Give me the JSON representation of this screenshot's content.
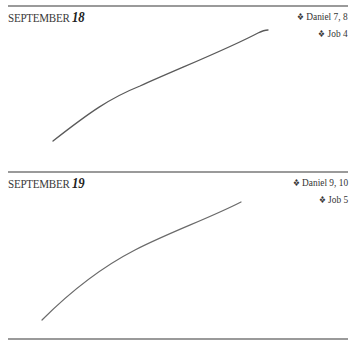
{
  "entries": [
    {
      "month": "SEPTEMBER",
      "day": "18",
      "readings": [
        "Daniel 7, 8",
        "Job 4"
      ],
      "bullet_icon": "❖"
    },
    {
      "month": "SEPTEMBER",
      "day": "19",
      "readings": [
        "Daniel 9, 10",
        "Job 5"
      ],
      "bullet_icon": "❖"
    }
  ],
  "colors": {
    "rule": "#9a9a9a",
    "ink": "#555555"
  }
}
